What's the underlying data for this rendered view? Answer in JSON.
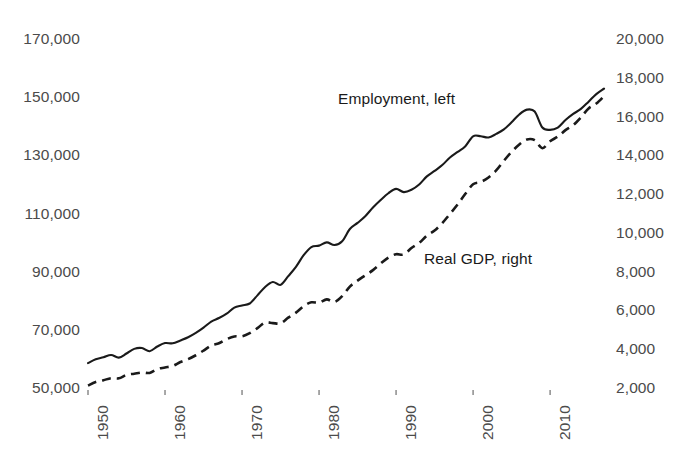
{
  "chart_data": {
    "type": "line",
    "title": "",
    "subtitle": "",
    "xlabel": "",
    "ylabel": "",
    "grid": false,
    "legend_position": "inline-annotation",
    "background_color": "#ffffff",
    "x": [
      1950,
      1951,
      1952,
      1953,
      1954,
      1955,
      1956,
      1957,
      1958,
      1959,
      1960,
      1961,
      1962,
      1963,
      1964,
      1965,
      1966,
      1967,
      1968,
      1969,
      1970,
      1971,
      1972,
      1973,
      1974,
      1975,
      1976,
      1977,
      1978,
      1979,
      1980,
      1981,
      1982,
      1983,
      1984,
      1985,
      1986,
      1987,
      1988,
      1989,
      1990,
      1991,
      1992,
      1993,
      1994,
      1995,
      1996,
      1997,
      1998,
      1999,
      2000,
      2001,
      2002,
      2003,
      2004,
      2005,
      2006,
      2007,
      2008,
      2009,
      2010,
      2011,
      2012,
      2013,
      2014,
      2015,
      2016,
      2017
    ],
    "xlim": [
      1950,
      2017
    ],
    "x_ticks": [
      1950,
      1960,
      1970,
      1980,
      1990,
      2000,
      2010
    ],
    "x_tick_labels": [
      "1950",
      "1960",
      "1970",
      "1980",
      "1990",
      "2000",
      "2010"
    ],
    "x_tick_rotation": -90,
    "left_axis": {
      "name": "Employment",
      "ylim": [
        50000,
        170000
      ],
      "ticks": [
        50000,
        70000,
        90000,
        110000,
        130000,
        150000,
        170000
      ],
      "tick_labels": [
        "50,000",
        "70,000",
        "90,000",
        "110,000",
        "130,000",
        "150,000",
        "170,000"
      ],
      "units": "thousands of persons"
    },
    "right_axis": {
      "name": "Real GDP",
      "ylim": [
        2000,
        20000
      ],
      "ticks": [
        2000,
        4000,
        6000,
        8000,
        10000,
        12000,
        14000,
        16000,
        18000,
        20000
      ],
      "tick_labels": [
        "2,000",
        "4,000",
        "6,000",
        "8,000",
        "10,000",
        "12,000",
        "14,000",
        "16,000",
        "18,000",
        "20,000"
      ],
      "units": "billions of chained dollars"
    },
    "series": [
      {
        "name": "Employment, left",
        "axis": "left",
        "style": "solid",
        "color": "#1a1a1a",
        "line_width": 2.1,
        "annotation": "Employment, left",
        "values": [
          58900,
          60200,
          60900,
          61700,
          60800,
          62200,
          63800,
          64100,
          63000,
          64600,
          65800,
          65700,
          66700,
          67800,
          69300,
          71100,
          73200,
          74400,
          75900,
          78000,
          78700,
          79400,
          82200,
          85100,
          86800,
          85800,
          88800,
          92000,
          96000,
          98800,
          99300,
          100400,
          99500,
          100800,
          105000,
          107100,
          109400,
          112400,
          115000,
          117300,
          118800,
          117700,
          118500,
          120300,
          123100,
          125000,
          127000,
          129600,
          131500,
          133500,
          136900,
          136900,
          136500,
          137700,
          139250,
          141700,
          144400,
          146050,
          145400,
          139900,
          139100,
          139900,
          142500,
          144600,
          146300,
          148800,
          151400,
          153300
        ]
      },
      {
        "name": "Real GDP, right",
        "axis": "right",
        "style": "dashed",
        "color": "#1a1a1a",
        "line_width": 2.6,
        "dash_pattern": "9 6",
        "annotation": "Real GDP, right",
        "values": [
          2180,
          2360,
          2450,
          2560,
          2550,
          2730,
          2790,
          2850,
          2830,
          3030,
          3110,
          3190,
          3390,
          3540,
          3740,
          3980,
          4240,
          4360,
          4570,
          4710,
          4720,
          4880,
          5140,
          5430,
          5400,
          5390,
          5680,
          5940,
          6270,
          6470,
          6450,
          6620,
          6490,
          6790,
          7280,
          7590,
          7860,
          8130,
          8470,
          8780,
          8950,
          8940,
          9270,
          9530,
          9910,
          10170,
          10560,
          11030,
          11520,
          12070,
          12560,
          12680,
          12910,
          13270,
          13770,
          14230,
          14610,
          14870,
          14830,
          14420,
          14780,
          15020,
          15350,
          15610,
          16010,
          16470,
          16720,
          17100
        ]
      }
    ],
    "annotations": [
      {
        "text": "Employment, left",
        "x_px": 338,
        "y_px": 90
      },
      {
        "text": "Real GDP, right",
        "x_px": 424,
        "y_px": 250
      }
    ]
  },
  "axes": {
    "left_tick_labels": [
      "170,000",
      "150,000",
      "130,000",
      "110,000",
      "90,000",
      "70,000",
      "50,000"
    ],
    "right_tick_labels": [
      "20,000",
      "18,000",
      "16,000",
      "14,000",
      "12,000",
      "10,000",
      "8,000",
      "6,000",
      "4,000",
      "2,000"
    ],
    "x_tick_labels": [
      "1950",
      "1960",
      "1970",
      "1980",
      "1990",
      "2000",
      "2010"
    ]
  },
  "annotations": {
    "employment": "Employment, left",
    "real_gdp": "Real GDP, right"
  },
  "colors": {
    "line": "#1a1a1a",
    "tick_text": "#4b4b4b",
    "annotation_text": "#1a1a1a",
    "background": "#ffffff"
  }
}
